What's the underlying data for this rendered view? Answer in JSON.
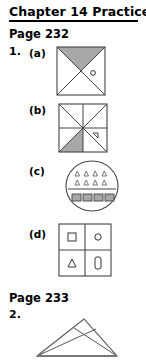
{
  "header": {
    "title": "Chapter 14 Practice"
  },
  "sections": [
    {
      "page_label": "Page 232",
      "item_number": "1.",
      "parts": [
        {
          "label": "(a)",
          "figure": "square-two-diagonals-top-shaded-with-circle-mark"
        },
        {
          "label": "(b)",
          "figure": "square-eight-triangles-one-shaded-with-triangle-mark"
        },
        {
          "label": "(c)",
          "figure": "circle-split-triangles-above-rectangles-below"
        },
        {
          "label": "(d)",
          "figure": "two-by-two-grid-square-circle-triangle-bar"
        }
      ]
    },
    {
      "page_label": "Page 233",
      "item_number": "2.",
      "parts": [
        {
          "label": "",
          "figure": "triangle-with-two-crossing-cevians"
        }
      ]
    }
  ],
  "figure_a": {
    "shape": "square",
    "diagonals": 2,
    "shaded_region": "top-triangle",
    "marks": [
      {
        "glyph": "circle",
        "region": "right-triangle"
      }
    ]
  },
  "figure_b": {
    "shape": "square",
    "regions": 8,
    "shaded_region": "bottom-left-lower-triangle",
    "marks": [
      {
        "glyph": "triangle",
        "region": "right-lower-triangle"
      }
    ]
  },
  "figure_c": {
    "shape": "circle",
    "divider": "horizontal",
    "top_rows": 2,
    "top_per_row": 4,
    "top_glyph": "triangle",
    "bottom_count": 4,
    "bottom_glyph": "rectangle",
    "bottom_filled": true
  },
  "figure_d": {
    "shape": "square-grid",
    "rows": 2,
    "cols": 2,
    "cells": [
      "square",
      "circle",
      "triangle",
      "vertical-bar"
    ]
  },
  "figure_2": {
    "shape": "triangle",
    "cevians": 2,
    "crossing": "near-apex"
  },
  "colors": {
    "ink": "#000000",
    "line": "#555555",
    "shade": "#a8a8a8",
    "page": "#ffffff"
  }
}
